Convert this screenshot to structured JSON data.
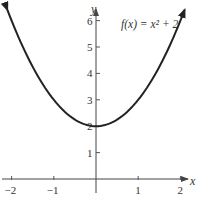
{
  "chart_data": {
    "type": "line",
    "title": "",
    "function_label": "f(x) = x² + 2",
    "xlabel": "x",
    "ylabel": "y",
    "xlim": [
      -2,
      2
    ],
    "ylim": [
      0,
      6.2
    ],
    "x_ticks": [
      -2,
      -1,
      1,
      2
    ],
    "y_ticks": [
      1,
      2,
      3,
      4,
      5,
      6
    ],
    "x_tick_labels": [
      "−2",
      "−1",
      "1",
      "2"
    ],
    "y_tick_labels": [
      "1",
      "2",
      "3",
      "4",
      "5",
      "6"
    ],
    "grid": false,
    "legend": "none",
    "series": [
      {
        "name": "f(x) = x^2 + 2",
        "x": [
          -2.1,
          -2,
          -1.5,
          -1,
          -0.5,
          0,
          0.5,
          1,
          1.5,
          2,
          2.1
        ],
        "y": [
          6.41,
          6,
          4.25,
          3,
          2.25,
          2,
          2.25,
          3,
          4.25,
          6,
          6.41
        ]
      }
    ],
    "annotations": [
      "arrows at both curve ends indicating continuation"
    ]
  }
}
